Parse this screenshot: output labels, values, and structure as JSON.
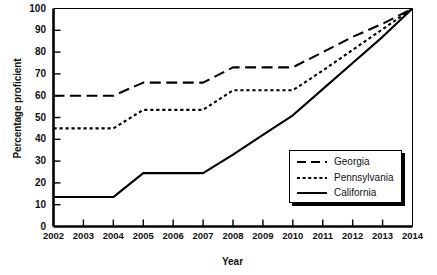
{
  "chart_data": {
    "type": "line",
    "title": "",
    "xlabel": "Year",
    "ylabel": "Percentage proficient",
    "x": [
      2002,
      2003,
      2004,
      2005,
      2006,
      2007,
      2008,
      2009,
      2010,
      2011,
      2012,
      2013,
      2014
    ],
    "xlim": [
      2002,
      2014
    ],
    "ylim": [
      0,
      100
    ],
    "yticks": [
      0,
      10,
      20,
      30,
      40,
      50,
      60,
      70,
      80,
      90,
      100
    ],
    "xticks": [
      "2002",
      "2003",
      "2004",
      "2005",
      "2006",
      "2007",
      "2008",
      "2009",
      "2010",
      "2011",
      "2012",
      "2013",
      "2014"
    ],
    "grid": false,
    "legend_position": "lower-right",
    "series": [
      {
        "name": "Georgia",
        "style": "long-dash",
        "color": "#000000",
        "values": [
          60,
          60,
          60,
          66,
          66,
          66,
          73,
          73,
          73,
          80,
          87,
          93,
          100
        ]
      },
      {
        "name": "Pennsylvania",
        "style": "dotted",
        "color": "#000000",
        "values": [
          45,
          45,
          45,
          53.5,
          53.5,
          53.5,
          62.5,
          62.5,
          62.5,
          71.5,
          81,
          90.5,
          100
        ]
      },
      {
        "name": "California",
        "style": "solid",
        "color": "#000000",
        "values": [
          13.5,
          13.5,
          13.5,
          24.5,
          24.5,
          24.5,
          33,
          42,
          51,
          63,
          75,
          87,
          100
        ]
      }
    ]
  },
  "legend": {
    "items": [
      {
        "label": "Georgia",
        "style": "long-dash"
      },
      {
        "label": "Pennsylvania",
        "style": "dotted"
      },
      {
        "label": "California",
        "style": "solid"
      }
    ]
  }
}
